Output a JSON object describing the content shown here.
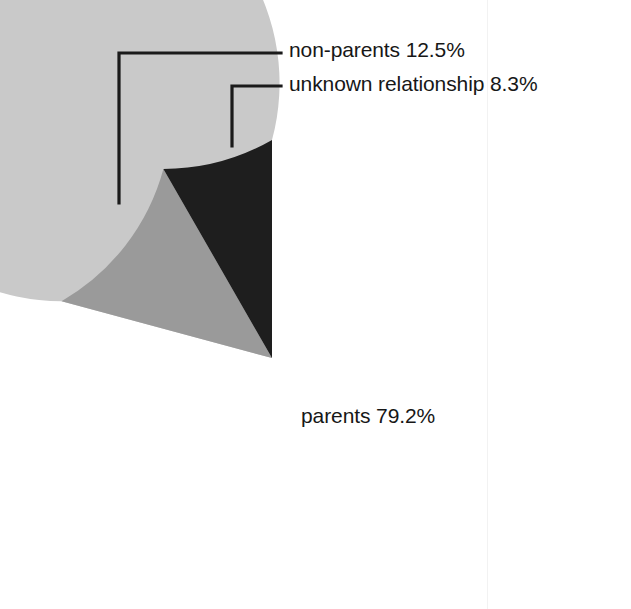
{
  "chart_data": {
    "type": "pie",
    "title": "",
    "subtitle": "",
    "xlabel": "",
    "ylabel": "",
    "legend_position": "none",
    "grid": false,
    "units": "percent",
    "total": 100,
    "start_angle_deg": 90,
    "direction": "counterclockwise",
    "categories": [
      "parents",
      "non-parents",
      "unknown relationship"
    ],
    "values": [
      79.2,
      12.5,
      8.3
    ],
    "labels": [
      "parents 79.2%",
      "non-parents 12.5%",
      "unknown relationship 8.3%"
    ],
    "slices": [
      {
        "name": "parents",
        "label": "parents 79.2%",
        "value": 79.2,
        "value_text": "79.2%",
        "color": "#c9c9c9",
        "label_placement": "inside",
        "leader_line": false
      },
      {
        "name": "non-parents",
        "label": "non-parents 12.5%",
        "value": 12.5,
        "value_text": "12.5%",
        "color": "#9a9a9a",
        "label_placement": "outside",
        "leader_line": true
      },
      {
        "name": "unknown relationship",
        "label": "unknown relationship 8.3%",
        "value": 8.3,
        "value_text": "8.3%",
        "color": "#1e1e1e",
        "label_placement": "outside",
        "leader_line": true
      }
    ],
    "colors": {
      "parents": "#c9c9c9",
      "non_parents": "#9a9a9a",
      "unknown_relationship": "#1e1e1e",
      "background": "#ffffff",
      "leader_line": "#1a1a1a",
      "text": "#171717"
    }
  },
  "figure": {
    "center_x": 272,
    "center_y": 358,
    "radius": 218
  }
}
